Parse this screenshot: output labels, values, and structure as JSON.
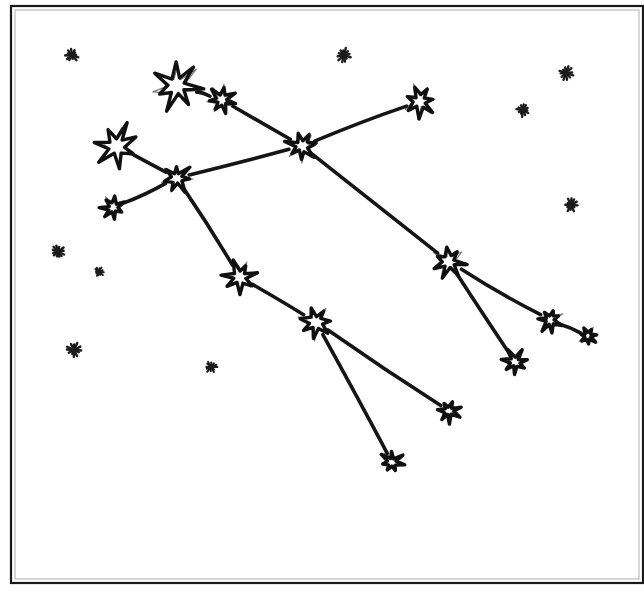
{
  "figure": {
    "background_color": "#ffffff",
    "ink_color": "#111111",
    "frame": {
      "label": "page-border",
      "x": 11,
      "y": 6,
      "width": 632,
      "height": 577,
      "stroke_color": "#1a1a1a",
      "stroke_width": 2.2
    }
  },
  "chart_data": {
    "type": "scatter",
    "xlabel": "",
    "ylabel": "",
    "xlim": [
      0,
      644
    ],
    "ylim": [
      0,
      592
    ],
    "grid": false,
    "legend": "none",
    "nodes": [
      {
        "id": "s1",
        "name": "bright-star-top-left-large",
        "x": 177,
        "y": 86,
        "size": 46,
        "points": 7,
        "magnitude": "bright"
      },
      {
        "id": "s2",
        "name": "bright-star-upper-left-small",
        "x": 222,
        "y": 100,
        "size": 28,
        "points": 7,
        "magnitude": "medium"
      },
      {
        "id": "s3",
        "name": "bright-star-top-right",
        "x": 420,
        "y": 101,
        "size": 32,
        "points": 7,
        "magnitude": "medium"
      },
      {
        "id": "s4",
        "name": "bright-star-hub-center",
        "x": 302,
        "y": 146,
        "size": 30,
        "points": 7,
        "magnitude": "medium"
      },
      {
        "id": "s5",
        "name": "bright-star-left-large",
        "x": 117,
        "y": 146,
        "size": 42,
        "points": 7,
        "magnitude": "bright"
      },
      {
        "id": "s6",
        "name": "bright-star-left-junction",
        "x": 177,
        "y": 178,
        "size": 28,
        "points": 7,
        "magnitude": "medium"
      },
      {
        "id": "s7",
        "name": "bright-star-left-lower",
        "x": 113,
        "y": 208,
        "size": 24,
        "points": 7,
        "magnitude": "faint"
      },
      {
        "id": "s8",
        "name": "bright-star-right-middle",
        "x": 449,
        "y": 262,
        "size": 32,
        "points": 7,
        "magnitude": "medium"
      },
      {
        "id": "s9",
        "name": "bright-star-mid-lower-left",
        "x": 240,
        "y": 277,
        "size": 32,
        "points": 7,
        "magnitude": "medium"
      },
      {
        "id": "s10",
        "name": "bright-star-lower-hub",
        "x": 316,
        "y": 322,
        "size": 32,
        "points": 7,
        "magnitude": "medium"
      },
      {
        "id": "s11",
        "name": "bright-star-right-chain-a",
        "x": 550,
        "y": 320,
        "size": 24,
        "points": 7,
        "magnitude": "faint"
      },
      {
        "id": "s12",
        "name": "bright-star-right-chain-b",
        "x": 588,
        "y": 336,
        "size": 18,
        "points": 7,
        "magnitude": "faint"
      },
      {
        "id": "s13",
        "name": "bright-star-lower-right-tip",
        "x": 515,
        "y": 362,
        "size": 24,
        "points": 7,
        "magnitude": "faint"
      },
      {
        "id": "s14",
        "name": "bright-star-bottom-right",
        "x": 449,
        "y": 411,
        "size": 22,
        "points": 7,
        "magnitude": "faint"
      },
      {
        "id": "s15",
        "name": "bright-star-bottom-center",
        "x": 392,
        "y": 462,
        "size": 22,
        "points": 7,
        "magnitude": "faint"
      }
    ],
    "edges": [
      {
        "from": "s1",
        "to": "s2",
        "name": "link-s1-s2"
      },
      {
        "from": "s2",
        "to": "s4",
        "name": "link-s2-s4"
      },
      {
        "from": "s3",
        "to": "s4",
        "name": "link-s3-s4"
      },
      {
        "from": "s4",
        "to": "s6",
        "name": "link-s4-s6"
      },
      {
        "from": "s5",
        "to": "s6",
        "name": "link-s5-s6"
      },
      {
        "from": "s6",
        "to": "s7",
        "name": "link-s6-s7"
      },
      {
        "from": "s6",
        "to": "s9",
        "name": "link-s6-s9"
      },
      {
        "from": "s4",
        "to": "s8",
        "name": "link-s4-s8"
      },
      {
        "from": "s9",
        "to": "s10",
        "name": "link-s9-s10"
      },
      {
        "from": "s8",
        "to": "s11",
        "name": "link-s8-s11"
      },
      {
        "from": "s11",
        "to": "s12",
        "name": "link-s11-s12"
      },
      {
        "from": "s8",
        "to": "s13",
        "name": "link-s8-s13"
      },
      {
        "from": "s10",
        "to": "s14",
        "name": "link-s10-s14"
      },
      {
        "from": "s10",
        "to": "s15",
        "name": "link-s10-s15"
      }
    ],
    "background_stars": [
      {
        "name": "bg-star-1",
        "x": 72,
        "y": 55,
        "size": 11,
        "points": 6
      },
      {
        "name": "bg-star-2",
        "x": 344,
        "y": 55,
        "size": 12,
        "points": 6
      },
      {
        "name": "bg-star-3",
        "x": 566,
        "y": 73,
        "size": 12,
        "points": 6
      },
      {
        "name": "bg-star-4",
        "x": 523,
        "y": 110,
        "size": 11,
        "points": 6
      },
      {
        "name": "bg-star-5",
        "x": 571,
        "y": 205,
        "size": 11,
        "points": 6
      },
      {
        "name": "bg-star-6",
        "x": 58,
        "y": 252,
        "size": 11,
        "points": 6
      },
      {
        "name": "bg-star-7",
        "x": 99,
        "y": 272,
        "size": 8,
        "points": 6
      },
      {
        "name": "bg-star-8",
        "x": 74,
        "y": 350,
        "size": 12,
        "points": 6
      },
      {
        "name": "bg-star-9",
        "x": 211,
        "y": 367,
        "size": 10,
        "points": 6
      }
    ]
  }
}
